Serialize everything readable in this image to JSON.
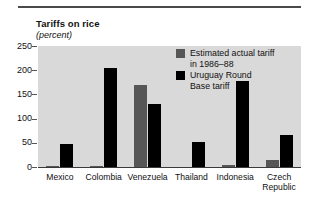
{
  "chart": {
    "title": "Tariffs on rice",
    "subtitle": "(percent)"
  },
  "legend": {
    "items": [
      {
        "name": "actual",
        "line1": "Estimated actual tariff",
        "line2": "in 1986–88",
        "color": "#565656"
      },
      {
        "name": "uruguay",
        "line1": "Uruguay Round",
        "line2": "Base tariff",
        "color": "#000000"
      }
    ]
  },
  "axes": {
    "y_ticks": [
      "250",
      "200",
      "150",
      "100",
      "50",
      "0"
    ],
    "x_labels": [
      {
        "line1": "Mexico",
        "line2": ""
      },
      {
        "line1": "Colombia",
        "line2": ""
      },
      {
        "line1": "Venezuela",
        "line2": ""
      },
      {
        "line1": "Thailand",
        "line2": ""
      },
      {
        "line1": "Indonesia",
        "line2": ""
      },
      {
        "line1": "Czech",
        "line2": "Republic"
      }
    ]
  },
  "chart_data": {
    "type": "bar",
    "title": "Tariffs on rice",
    "subtitle": "(percent)",
    "xlabel": "",
    "ylabel": "percent",
    "ylim": [
      0,
      250
    ],
    "yticks": [
      0,
      50,
      100,
      150,
      200,
      250
    ],
    "grid": false,
    "legend_position": "inside-top-right",
    "categories": [
      "Mexico",
      "Colombia",
      "Venezuela",
      "Thailand",
      "Indonesia",
      "Czech Republic"
    ],
    "series": [
      {
        "name": "Estimated actual tariff in 1986–88",
        "color": "#565656",
        "values": [
          3,
          3,
          170,
          0,
          4,
          14
        ]
      },
      {
        "name": "Uruguay Round Base tariff",
        "color": "#000000",
        "values": [
          48,
          205,
          130,
          52,
          178,
          67
        ]
      }
    ]
  }
}
